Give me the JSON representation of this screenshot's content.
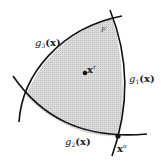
{
  "diagram": {
    "type": "feasible-region",
    "region_label": "F",
    "colors": {
      "region_fill": "#d4d4d4",
      "boundary": "#111111",
      "background": "#ffffff"
    },
    "constraints": [
      {
        "id": "g1",
        "name": "g",
        "subscript": "1",
        "arg": "(x)",
        "position": "right"
      },
      {
        "id": "g2",
        "name": "g",
        "subscript": "2",
        "arg": "(x)",
        "position": "bottom"
      },
      {
        "id": "g3",
        "name": "g",
        "subscript": "3",
        "arg": "(x)",
        "position": "top-left"
      }
    ],
    "points": [
      {
        "id": "interior",
        "name": "x",
        "superscript": "r",
        "position": "center"
      },
      {
        "id": "vertex",
        "name": "x",
        "superscript": "o",
        "position": "bottom-right"
      }
    ]
  }
}
